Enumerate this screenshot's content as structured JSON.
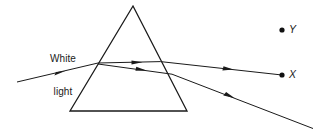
{
  "diagram": {
    "background_color": "#ffffff",
    "ink_color": "#1a1a1a",
    "width": 319,
    "height": 132,
    "labels": {
      "source_line1": "White",
      "source_line2": "light",
      "point_y": "Y",
      "point_x": "X"
    },
    "prism": {
      "name": "triangular-prism",
      "apex": [
        133,
        6
      ],
      "base_left": [
        70,
        111
      ],
      "base_right": [
        187,
        111
      ]
    },
    "points": [
      {
        "name": "point-y",
        "label": "Y",
        "x": 282,
        "y": 30
      },
      {
        "name": "point-x",
        "label": "X",
        "x": 282,
        "y": 75
      }
    ],
    "rays": [
      {
        "name": "incident-white-light-ray",
        "from": [
          17,
          82
        ],
        "to": [
          98,
          63
        ],
        "arrow_at": [
          60,
          73
        ]
      },
      {
        "name": "internal-ray-upper",
        "from": [
          98,
          63
        ],
        "to": [
          160,
          62
        ],
        "arrow_at": [
          137,
          62
        ]
      },
      {
        "name": "internal-ray-lower",
        "from": [
          98,
          64
        ],
        "to": [
          172,
          74
        ],
        "arrow_at": [
          141,
          69
        ]
      },
      {
        "name": "emergent-ray-to-x",
        "from": [
          160,
          62
        ],
        "to": [
          282,
          75
        ],
        "arrow_at": [
          228,
          68
        ]
      },
      {
        "name": "emergent-ray-lower",
        "from": [
          172,
          74
        ],
        "to": [
          312,
          128
        ],
        "arrow_at": [
          229,
          96
        ]
      }
    ]
  }
}
